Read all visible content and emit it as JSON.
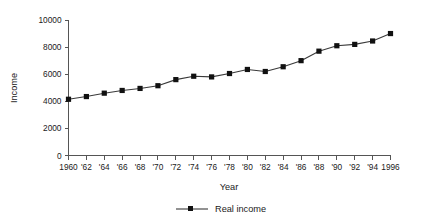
{
  "chart_data": {
    "type": "line",
    "title": "",
    "xlabel": "Year",
    "ylabel": "Income",
    "xlim": [
      1960,
      1996
    ],
    "ylim": [
      0,
      10000
    ],
    "grid": false,
    "legend_position": "bottom-center",
    "x_tick_labels": [
      "1960",
      "'62",
      "'64",
      "'66",
      "'68",
      "'70",
      "'72",
      "'74",
      "'76",
      "'78",
      "'80",
      "'82",
      "'84",
      "'86",
      "'88",
      "'90",
      "'92",
      "'94",
      "1996"
    ],
    "y_tick_labels": [
      "0",
      "2000",
      "4000",
      "6000",
      "8000",
      "10000"
    ],
    "y_ticks": [
      0,
      2000,
      4000,
      6000,
      8000,
      10000
    ],
    "x": [
      1960,
      1962,
      1964,
      1966,
      1968,
      1970,
      1972,
      1974,
      1976,
      1978,
      1980,
      1982,
      1984,
      1986,
      1988,
      1990,
      1992,
      1994,
      1996
    ],
    "series": [
      {
        "name": "Real income",
        "marker": "square",
        "color": "#111111",
        "values": [
          4150,
          4350,
          4600,
          4800,
          4950,
          5150,
          5600,
          5850,
          5800,
          6050,
          6350,
          6200,
          6550,
          7000,
          7700,
          8100,
          8200,
          8450,
          9000
        ]
      }
    ]
  },
  "legend": {
    "entries": [
      {
        "label": "Real income"
      }
    ]
  },
  "axes": {
    "x_title": "Year",
    "y_title": "Income"
  }
}
